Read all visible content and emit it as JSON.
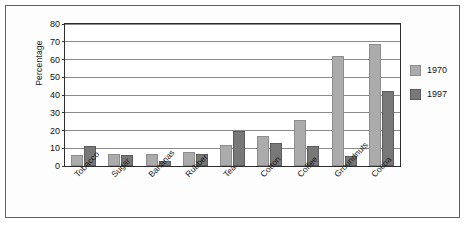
{
  "chart_data": {
    "type": "bar",
    "title": "",
    "subtitle": "",
    "xlabel": "",
    "ylabel": "Percentage",
    "ylim": [
      0,
      80
    ],
    "yticks": [
      0,
      10,
      20,
      30,
      40,
      50,
      60,
      70,
      80
    ],
    "ytick_labels": [
      "0",
      "10",
      "20",
      "30",
      "40",
      "50",
      "60",
      "70",
      "80"
    ],
    "grid": "horizontal",
    "legend_position": "right",
    "categories": [
      "Tobacco",
      "Sugar",
      "Bananas",
      "Rubber",
      "Tea",
      "Cotton",
      "Coffee",
      "Groundnuts",
      "Cocoa"
    ],
    "series": [
      {
        "name": "1970",
        "color": "#ababab",
        "values": [
          6,
          7,
          7,
          8,
          12,
          17,
          26,
          62,
          69
        ]
      },
      {
        "name": "1997",
        "color": "#787878",
        "values": [
          11,
          6,
          3,
          6.5,
          19.5,
          13,
          11,
          5.5,
          42.5
        ]
      }
    ]
  },
  "legend": {
    "items": [
      {
        "label": "1970",
        "color": "#ababab"
      },
      {
        "label": "1997",
        "color": "#787878"
      }
    ]
  },
  "axes": {
    "y_title": "Percentage"
  }
}
